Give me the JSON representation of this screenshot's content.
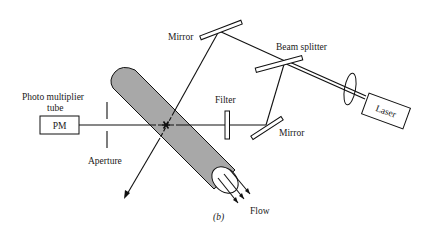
{
  "figure": {
    "caption": "(b)",
    "type": "optical setup schematic (laser Doppler / flow cytometry style)"
  },
  "labels": {
    "photomultiplier_line1": "Photo multiplier",
    "photomultiplier_line2": "tube",
    "pm_box": "PM",
    "aperture": "Aperture",
    "filter": "Filter",
    "mirror_top": "Mirror",
    "mirror_right": "Mirror",
    "beam_splitter": "Beam splitter",
    "laser": "Laser",
    "flow": "Flow"
  },
  "colors": {
    "line": "#111111",
    "tube_fill": "#a8a8a8",
    "background": "#ffffff"
  },
  "components": [
    {
      "name": "Laser",
      "role": "light source"
    },
    {
      "name": "Lens",
      "role": "focusing"
    },
    {
      "name": "Beam splitter",
      "role": "split beam"
    },
    {
      "name": "Mirror",
      "role": "redirect beam (top)"
    },
    {
      "name": "Mirror",
      "role": "redirect beam (right)"
    },
    {
      "name": "Filter",
      "role": "optical filter"
    },
    {
      "name": "Aperture",
      "role": "spatial filter"
    },
    {
      "name": "PM",
      "role": "photomultiplier tube detector"
    },
    {
      "name": "Flow tube",
      "role": "sample flow"
    }
  ]
}
